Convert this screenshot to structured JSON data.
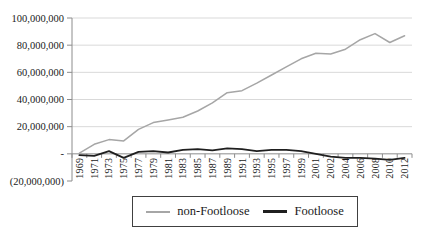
{
  "chart_data": {
    "type": "line",
    "title": "",
    "xlabel": "",
    "ylabel": "",
    "grid": true,
    "legend_position": "bottom-center-boxed",
    "categories": [
      "1969",
      "1971",
      "1973",
      "1975",
      "1977",
      "1979",
      "1981",
      "1983",
      "1985",
      "1987",
      "1989",
      "1991",
      "1993",
      "1995",
      "1997",
      "1999",
      "2001",
      "2002",
      "2004",
      "2006",
      "2008",
      "2010",
      "2012"
    ],
    "series": [
      {
        "name": "non-Footloose",
        "color": "#a6a6a6",
        "stroke_width": 1.5,
        "values": [
          500000,
          7000000,
          10500000,
          9500000,
          18000000,
          23000000,
          25000000,
          27000000,
          31500000,
          37500000,
          45000000,
          46500000,
          52000000,
          58000000,
          64000000,
          70000000,
          74000000,
          73500000,
          77000000,
          84000000,
          88500000,
          82000000,
          87000000
        ]
      },
      {
        "name": "Footloose",
        "color": "#1f1f1f",
        "stroke_width": 1.8,
        "values": [
          -1000000,
          -1500000,
          2000000,
          -3000000,
          1500000,
          2000000,
          1000000,
          3000000,
          3500000,
          2500000,
          4000000,
          3500000,
          2000000,
          3000000,
          3000000,
          2000000,
          0,
          -2000000,
          -3000000,
          -3000000,
          -3500000,
          -4500000,
          -3000000
        ]
      }
    ],
    "ylim": [
      -20000000,
      100000000
    ],
    "y_major_unit": 20000000,
    "y_ticks": [
      {
        "value": 100000000,
        "label": "100,000,000"
      },
      {
        "value": 80000000,
        "label": "80,000,000"
      },
      {
        "value": 60000000,
        "label": "60,000,000"
      },
      {
        "value": 40000000,
        "label": "40,000,000"
      },
      {
        "value": 20000000,
        "label": "20,000,000"
      },
      {
        "value": 0,
        "label": "-"
      },
      {
        "value": -20000000,
        "label": "(20,000,000)"
      }
    ],
    "gridline_values": [
      100000000,
      80000000,
      60000000,
      40000000,
      20000000
    ],
    "colors": {
      "background": "#ffffff",
      "gridline": "#d9d9d9",
      "axis": "#8c8c8c",
      "label_text": "#1a1a1a",
      "legend_border": "#404040"
    }
  }
}
